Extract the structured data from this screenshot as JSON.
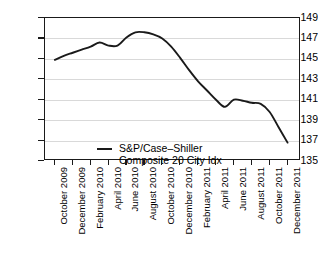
{
  "chart_data": {
    "type": "line",
    "title": "",
    "subtitle": "",
    "xlabel": "",
    "ylabel": "",
    "grid": true,
    "legend_position": "inside-lower-left",
    "ylim": [
      135,
      149
    ],
    "yticks": [
      135,
      137,
      139,
      141,
      143,
      145,
      147,
      149
    ],
    "ytick_labels": [
      "135",
      "137",
      "139",
      "141",
      "143",
      "145",
      "147",
      "149"
    ],
    "xticks": [
      "October 2009",
      "December 2009",
      "February 2010",
      "April 2010",
      "June 2010",
      "August 2010",
      "October 2010",
      "December 2010",
      "February 2011",
      "April 2011",
      "June 2011",
      "August 2011",
      "October 2011",
      "December 2011"
    ],
    "series": [
      {
        "name": "S&P/Case–Shiller Composite 20 City Idx",
        "color": "#1a1a1a",
        "x": [
          "October 2009",
          "November 2009",
          "December 2009",
          "January 2010",
          "February 2010",
          "March 2010",
          "April 2010",
          "May 2010",
          "June 2010",
          "July 2010",
          "August 2010",
          "September 2010",
          "October 2010",
          "November 2010",
          "December 2010",
          "January 2011",
          "February 2011",
          "March 2011",
          "April 2011",
          "May 2011",
          "June 2011",
          "July 2011",
          "August 2011",
          "September 2011",
          "October 2011",
          "November 2011",
          "December 2011"
        ],
        "values": [
          144.9,
          145.3,
          145.6,
          145.9,
          146.2,
          146.6,
          146.3,
          146.3,
          147.1,
          147.6,
          147.6,
          147.4,
          147.0,
          146.2,
          145.1,
          143.9,
          142.8,
          141.9,
          141.0,
          140.3,
          141.0,
          140.9,
          140.7,
          140.6,
          139.8,
          138.3,
          136.8
        ]
      }
    ],
    "annotations": []
  },
  "legend": {
    "entries": [
      {
        "label": "S&P/Case–Shiller\nComposite 20 City Idx",
        "color": "#1a1a1a"
      }
    ]
  },
  "axis": {
    "y": {
      "labels": [
        "149",
        "147",
        "145",
        "143",
        "141",
        "139",
        "137",
        "135"
      ]
    },
    "x": {
      "labels": [
        "October 2009",
        "December 2009",
        "February 2010",
        "April 2010",
        "June 2010",
        "August 2010",
        "October 2010",
        "December 2010",
        "February 2011",
        "April 2011",
        "June 2011",
        "August 2011",
        "October 2011",
        "December 2011"
      ]
    }
  },
  "colors": {
    "series": "#1a1a1a",
    "frame": "#1a1a1a",
    "grid": "#d9d9d9",
    "background": "#ffffff"
  }
}
